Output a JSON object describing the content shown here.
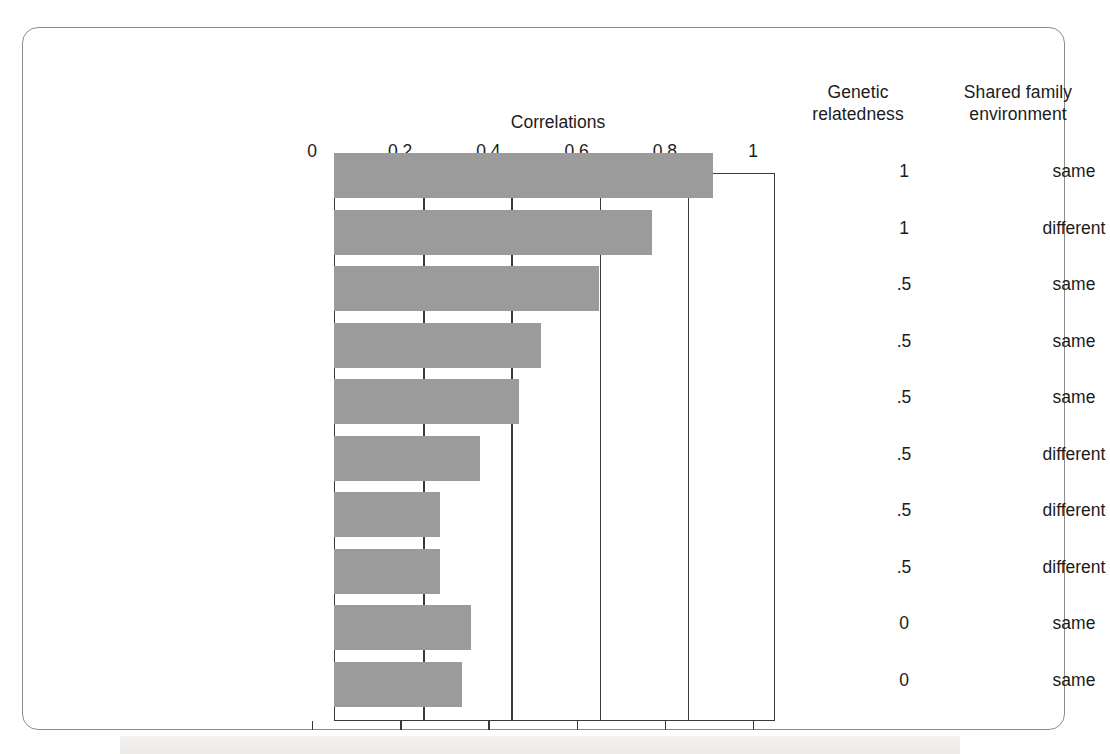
{
  "figure": {
    "chart_title": "Correlations",
    "columns": {
      "genetic_relatedness": "Genetic\nrelatedness",
      "genetic_line1": "Genetic",
      "genetic_line2": "relatedness",
      "shared_line1": "Shared family",
      "shared_line2": "environment"
    }
  },
  "chart_data": {
    "type": "bar",
    "orientation": "horizontal",
    "title": "Correlations",
    "xlabel": "Correlations",
    "ylabel": "",
    "xlim": [
      0,
      1
    ],
    "grid": true,
    "tick_labels": [
      "0",
      "0.2",
      "0.4",
      "0.6",
      "0.8",
      "1"
    ],
    "ticks": [
      0,
      0.2,
      0.4,
      0.6,
      0.8,
      1
    ],
    "categories": [
      "Identical twins, reared together",
      "Identical twins, reared apart",
      "Fraternal twins, reared together",
      "Siblings, reared together",
      "Parent/child, reared together",
      "Fraternal twins, reared apart",
      "Siblings, reared apart",
      "Parent/child, reared apart",
      "Siblings, adoptive",
      "Parent/child, adoptive"
    ],
    "values": [
      0.86,
      0.72,
      0.6,
      0.47,
      0.42,
      0.33,
      0.24,
      0.24,
      0.31,
      0.29
    ],
    "extra_columns": {
      "genetic_relatedness": [
        "1",
        "1",
        ".5",
        ".5",
        ".5",
        ".5",
        ".5",
        ".5",
        "0",
        "0"
      ],
      "shared_family_environment": [
        "same",
        "different",
        "same",
        "same",
        "same",
        "different",
        "different",
        "different",
        "same",
        "same"
      ]
    },
    "bar_color": "#9b9b9b",
    "axis_color": "#3a3a3a"
  },
  "rows": [
    {
      "label": "Identical twins, reared together",
      "value": 0.86,
      "genetic": "1",
      "shared": "same"
    },
    {
      "label": "Identical twins, reared apart",
      "value": 0.72,
      "genetic": "1",
      "shared": "different"
    },
    {
      "label": "Fraternal twins, reared together",
      "value": 0.6,
      "genetic": ".5",
      "shared": "same"
    },
    {
      "label": "Siblings, reared together",
      "value": 0.47,
      "genetic": ".5",
      "shared": "same"
    },
    {
      "label": "Parent/child, reared together",
      "value": 0.42,
      "genetic": ".5",
      "shared": "same"
    },
    {
      "label": "Fraternal twins, reared apart",
      "value": 0.33,
      "genetic": ".5",
      "shared": "different"
    },
    {
      "label": "Siblings, reared apart",
      "value": 0.24,
      "genetic": ".5",
      "shared": "different"
    },
    {
      "label": "Parent/child, reared apart",
      "value": 0.24,
      "genetic": ".5",
      "shared": "different"
    },
    {
      "label": "Siblings, adoptive",
      "value": 0.31,
      "genetic": "0",
      "shared": "same"
    },
    {
      "label": "Parent/child, adoptive",
      "value": 0.29,
      "genetic": "0",
      "shared": "same"
    }
  ]
}
